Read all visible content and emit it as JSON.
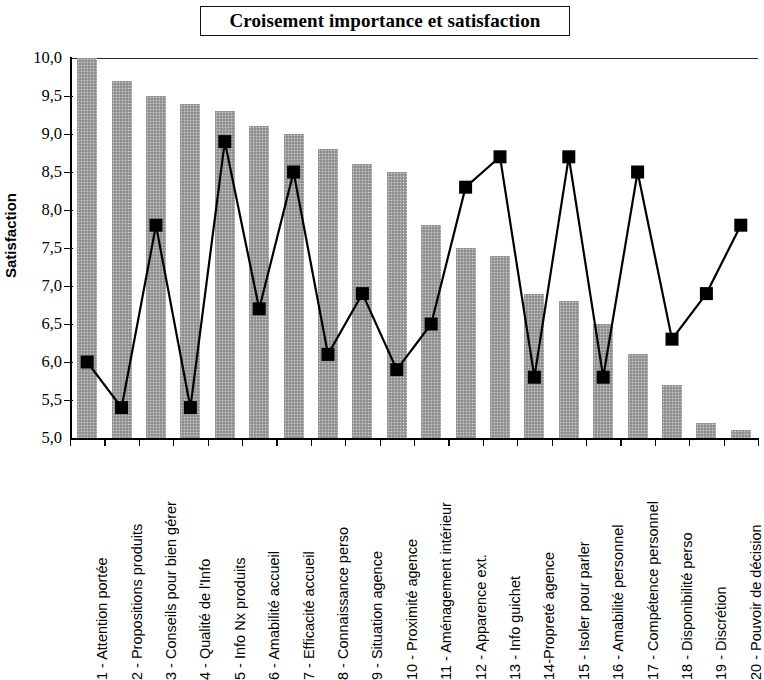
{
  "chart": {
    "title": "Croisement importance et satisfaction",
    "y_axis_title": "Satisfaction"
  },
  "chart_data": {
    "type": "bar",
    "title": "Croisement importance et satisfaction",
    "xlabel": "",
    "ylabel": "Satisfaction",
    "ylim": [
      5.0,
      10.0
    ],
    "ytick_step": 0.5,
    "ytick_labels": [
      "10,0",
      "9,5",
      "9,0",
      "8,5",
      "8,0",
      "7,5",
      "7,0",
      "6,5",
      "6,0",
      "5,5",
      "5,0"
    ],
    "ytick_values": [
      10.0,
      9.5,
      9.0,
      8.5,
      8.0,
      7.5,
      7.0,
      6.5,
      6.0,
      5.5,
      5.0
    ],
    "grid": false,
    "legend": "none",
    "decimal_separator": ",",
    "categories": [
      "1 - Attention portée",
      "2 - Propositions produits",
      "3 - Conseils pour bien gérer",
      "4 - Qualité de l'Info",
      "5 - Info Nx produits",
      "6 - Amabilité accueil",
      "7 - Efficacité accueil",
      "8 - Connaissance perso",
      "9 - Situation agence",
      "10 - Proximité agence",
      "11 - Aménagement intérieur",
      "12 - Apparence ext.",
      "13 - Info guichet",
      "14-Propreté agence",
      "15 - Isoler pour parler",
      "16 - Amabilité personnel",
      "17 - Compétence personnel",
      "18 - Disponibilité perso",
      "19 - Discrétion",
      "20 - Pouvoir de décision"
    ],
    "series": [
      {
        "name": "Importance",
        "render": "bar",
        "color": "#9e9e9e",
        "values": [
          10.0,
          9.7,
          9.5,
          9.4,
          9.3,
          9.1,
          9.0,
          8.8,
          8.6,
          8.5,
          7.8,
          7.5,
          7.4,
          6.9,
          6.8,
          6.5,
          6.1,
          5.7,
          5.2,
          5.1
        ]
      },
      {
        "name": "Satisfaction",
        "render": "line-marker",
        "color": "#000000",
        "marker": "square",
        "values": [
          6.0,
          5.4,
          7.8,
          5.4,
          8.9,
          6.7,
          8.5,
          6.1,
          6.9,
          5.9,
          6.5,
          8.3,
          8.7,
          5.8,
          8.7,
          5.8,
          8.5,
          6.3,
          6.9,
          7.8
        ]
      }
    ]
  }
}
